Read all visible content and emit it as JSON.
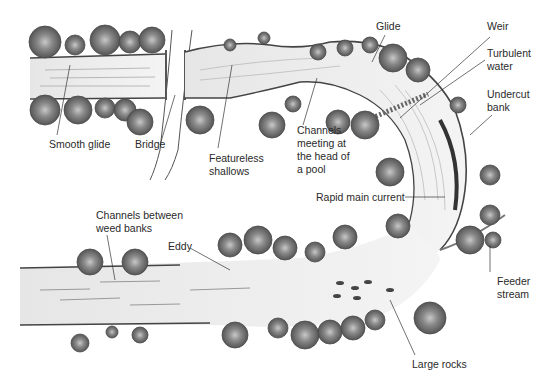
{
  "diagram": {
    "colors": {
      "water": "#eeeeee",
      "bank": "#4a4a4a",
      "tree_dark": "#5a5a5a",
      "tree_light": "#9a9a9a",
      "leader": "#333333",
      "text": "#2a2a2a"
    },
    "labels": {
      "smooth_glide": [
        "Smooth glide"
      ],
      "bridge": [
        "Bridge"
      ],
      "featureless_shallows": [
        "Featureless",
        "shallows"
      ],
      "glide": [
        "Glide"
      ],
      "channels_meeting": [
        "Channels",
        "meeting at",
        "the head of",
        "a pool"
      ],
      "weir": [
        "Weir"
      ],
      "turbulent_water": [
        "Turbulent",
        "water"
      ],
      "undercut_bank": [
        "Undercut",
        "bank"
      ],
      "rapid_main_current": [
        "Rapid main current"
      ],
      "channels_between_weed_banks": [
        "Channels between",
        "weed banks"
      ],
      "eddy": [
        "Eddy"
      ],
      "feeder_stream": [
        "Feeder",
        "stream"
      ],
      "large_rocks": [
        "Large rocks"
      ]
    }
  }
}
